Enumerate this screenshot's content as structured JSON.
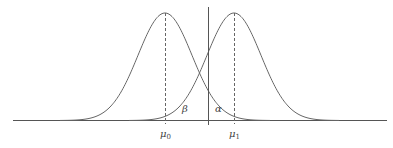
{
  "diagram": {
    "type": "hypothesis-test-normal-distributions",
    "curves": [
      {
        "name": "null-distribution",
        "mean_label": "μ",
        "mean_sub": "0",
        "peak_x": 165
      },
      {
        "name": "alternative-distribution",
        "mean_label": "μ",
        "mean_sub": "1",
        "peak_x": 234
      }
    ],
    "threshold_x": 208,
    "regions": {
      "beta": "β",
      "alpha": "α"
    },
    "colors": {
      "line": "#555555",
      "text": "#444444",
      "background": "#ffffff"
    }
  }
}
